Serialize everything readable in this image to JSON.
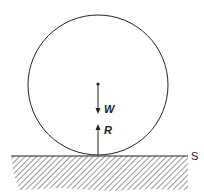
{
  "diagram": {
    "labels": {
      "weight": "W",
      "reaction": "R",
      "surface": "S"
    },
    "colors": {
      "stroke": "#222222",
      "hatch": "#555555",
      "background": "#ffffff"
    }
  }
}
